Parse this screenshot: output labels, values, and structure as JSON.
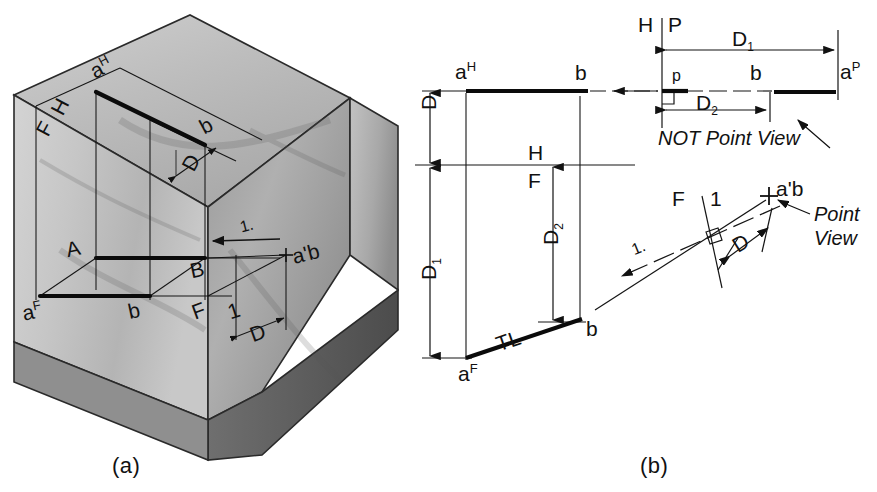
{
  "figure": {
    "captions": [
      {
        "id": "a",
        "text": "(a)"
      },
      {
        "id": "b",
        "text": "(b)"
      }
    ]
  },
  "pictorial": {
    "name": "pictorial-wedge-block",
    "labels": {
      "a_h": "a",
      "a_h_sup": "H",
      "b_top": "b",
      "fold_h": "H",
      "fold_f": "F",
      "dim_d_top": "D",
      "point_A": "A",
      "point_B": "B",
      "a_f": "a",
      "a_f_sup": "F",
      "b_front": "b",
      "fold_f2": "F",
      "fold_1": "1",
      "sight_line": "1.",
      "point_view": "a'b",
      "dim_d_right": "D"
    }
  },
  "orthographic": {
    "name": "orthographic-construction",
    "top_view": {
      "a_label": "a",
      "a_sup": "H",
      "b_label": "b"
    },
    "front_view": {
      "a_label": "a",
      "a_sup": "F",
      "b_label": "b",
      "true_length": "TL"
    },
    "profile_view": {
      "p_label": "p",
      "b_label": "b",
      "a_label": "a",
      "a_sup": "P",
      "note": "NOT Point View"
    },
    "aux_view": {
      "point_label": "a'b",
      "note_line1": "Point",
      "note_line2": "View",
      "sight_line": "1."
    },
    "fold_lines": [
      {
        "name": "h-f-fold",
        "upper": "H",
        "lower": "F"
      },
      {
        "name": "h-p-fold",
        "left": "H",
        "right": "P"
      },
      {
        "name": "f-1-fold",
        "left": "F",
        "right": "1"
      }
    ],
    "dimensions": [
      {
        "name": "dim-D-top-left",
        "label": "D",
        "sub": ""
      },
      {
        "name": "dim-D1-left",
        "label": "D",
        "sub": "1"
      },
      {
        "name": "dim-D2-center",
        "label": "D",
        "sub": "2"
      },
      {
        "name": "dim-D1-top-right",
        "label": "D",
        "sub": "1"
      },
      {
        "name": "dim-D2-right",
        "label": "D",
        "sub": "2"
      },
      {
        "name": "dim-D-aux",
        "label": "D",
        "sub": ""
      }
    ]
  },
  "colors": {
    "ink": "#111111",
    "thin": "#222222",
    "paper": "#ffffff",
    "shade_light": "#d8d8d8",
    "shade_mid": "#bdbdbd",
    "shade_dark": "#8e8e8e",
    "shade_darker": "#6a6a6a"
  }
}
